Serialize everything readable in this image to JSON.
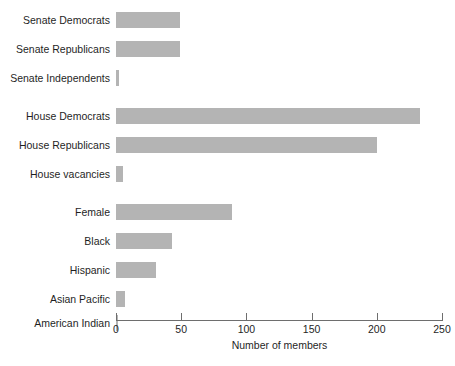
{
  "chart_data": {
    "type": "bar",
    "orientation": "horizontal",
    "title": "",
    "xlabel": "Number of members",
    "ylabel": "",
    "xlim": [
      0,
      250
    ],
    "xticks": [
      0,
      50,
      100,
      150,
      200,
      250
    ],
    "xtick_labels": [
      "0",
      "50",
      "100",
      "150",
      "200",
      "250"
    ],
    "grid": false,
    "legend": "none",
    "bar_color": "#b4b4b4",
    "axis_color": "#6e6e6e",
    "groups": [
      {
        "name": "senate",
        "categories": [
          "Senate Democrats",
          "Senate Republicans",
          "Senate Independents"
        ],
        "values": [
          49,
          49,
          2
        ]
      },
      {
        "name": "house",
        "categories": [
          "House Democrats",
          "House Republicans",
          "House vacancies"
        ],
        "values": [
          233,
          200,
          5
        ]
      },
      {
        "name": "demographics",
        "categories": [
          "Female",
          "Black",
          "Hispanic",
          "Asian Pacific",
          "American Indian"
        ],
        "values": [
          89,
          43,
          31,
          7,
          1
        ]
      }
    ],
    "categories": [
      "Senate Democrats",
      "Senate Republicans",
      "Senate Independents",
      "House Democrats",
      "House Republicans",
      "House vacancies",
      "Female",
      "Black",
      "Hispanic",
      "Asian Pacific",
      "American Indian"
    ],
    "values": [
      49,
      49,
      2,
      233,
      200,
      5,
      89,
      43,
      31,
      7,
      1
    ]
  },
  "bars": [
    {
      "label": "Senate Democrats",
      "value": 49,
      "top": 4
    },
    {
      "label": "Senate Republicans",
      "value": 49,
      "top": 33
    },
    {
      "label": "Senate Independents",
      "value": 2,
      "top": 62
    },
    {
      "label": "House Democrats",
      "value": 233,
      "top": 100
    },
    {
      "label": "House Republicans",
      "value": 200,
      "top": 129
    },
    {
      "label": "House vacancies",
      "value": 5,
      "top": 158
    },
    {
      "label": "Female",
      "value": 89,
      "top": 196
    },
    {
      "label": "Black",
      "value": 43,
      "top": 225
    },
    {
      "label": "Hispanic",
      "value": 31,
      "top": 254
    },
    {
      "label": "Asian Pacific",
      "value": 7,
      "top": 283
    },
    {
      "label": "American Indian",
      "value": 1,
      "top": 307
    }
  ],
  "axis": {
    "title": "Number of members",
    "ticks": [
      "0",
      "50",
      "100",
      "150",
      "200",
      "250"
    ]
  },
  "caption": ""
}
